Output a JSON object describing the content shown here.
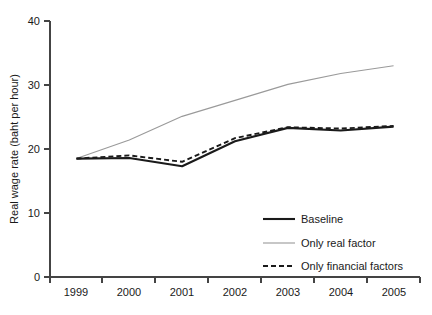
{
  "chart_data": {
    "type": "line",
    "title": "",
    "xlabel": "",
    "ylabel": "Real wage rate (baht per hour)",
    "categories": [
      "1999",
      "2000",
      "2001",
      "2002",
      "2003",
      "2004",
      "2005"
    ],
    "x": [
      1999,
      2000,
      2001,
      2002,
      2003,
      2004,
      2005
    ],
    "xlim": [
      1998.5,
      2005.5
    ],
    "ylim": [
      0,
      40
    ],
    "yticks": [
      0,
      10,
      20,
      30,
      40
    ],
    "ytick_labels": [
      "0",
      "10",
      "20",
      "30",
      "40"
    ],
    "grid": false,
    "legend_position": "lower right",
    "series": [
      {
        "name": "Baseline",
        "style": "solid-thick",
        "color": "#1a1a1a",
        "values": [
          18.5,
          18.6,
          17.3,
          21.2,
          23.3,
          22.9,
          23.5
        ]
      },
      {
        "name": "Only real factor",
        "style": "solid-thin",
        "color": "#9a9a9a",
        "values": [
          18.5,
          21.4,
          25.1,
          27.6,
          30.1,
          31.8,
          33.0
        ]
      },
      {
        "name": "Only financial factors",
        "style": "dashed",
        "color": "#1a1a1a",
        "values": [
          18.5,
          19.0,
          18.0,
          21.7,
          23.4,
          23.2,
          23.6
        ]
      }
    ]
  },
  "axes": {
    "y_axis_title": "Real wage rate (baht per hour)"
  },
  "legend": {
    "items": [
      {
        "label": "Baseline"
      },
      {
        "label": "Only real factor"
      },
      {
        "label": "Only financial factors"
      }
    ]
  }
}
